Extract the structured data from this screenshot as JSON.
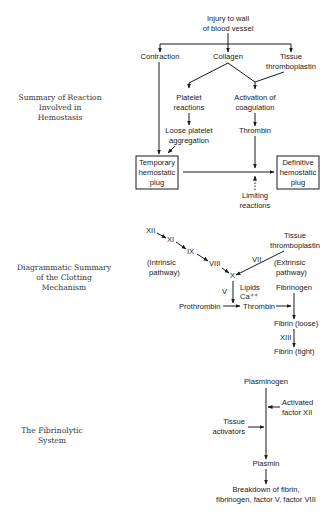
{
  "page": {
    "number": ""
  },
  "section1": {
    "caption": [
      "Summary of Reaction",
      "Involved in",
      "Hemostasis"
    ],
    "nodes": {
      "injury": [
        "Injury to wall",
        "of blood vessel"
      ],
      "contraction": "Contraction",
      "collagen": "Collagen",
      "tissue_thromboplastin": [
        "Tissue",
        "thromboplastin"
      ],
      "platelet_reactions": [
        "Platelet",
        "reactions"
      ],
      "activation": [
        "Activation of",
        "coagulation"
      ],
      "loose_aggregation": [
        "Loose platelet",
        "aggregation"
      ],
      "thrombin": "Thrombin",
      "temporary_plug": [
        "Temporary",
        "hemostatic",
        "plug"
      ],
      "definitive_plug": [
        "Definitive",
        "hemostatic",
        "plug"
      ],
      "limiting": [
        "Limiting",
        "reactions"
      ]
    }
  },
  "section2": {
    "caption": [
      "Diagrammatic Summary",
      "of the Clotting",
      "Mechanism"
    ],
    "nodes": {
      "xii": "XII",
      "xi": "XI",
      "ix": "IX",
      "viii": "VIII",
      "x": "X",
      "vii": "VII",
      "v": "V",
      "intrinsic": [
        "(Intrinsic",
        "pathway)"
      ],
      "extrinsic": [
        "(Extrinsic",
        "pathway)"
      ],
      "tissue_thromboplastin": [
        "Tissue",
        "thromboplastin"
      ],
      "lipids": "Lipids",
      "ca": "Ca⁺⁺",
      "prothrombin": "Prothrombin",
      "thrombin": "Thrombin",
      "fibrinogen": "Fibrinogen",
      "fibrin_loose": "Fibrin (loose)",
      "xiii": "XIII",
      "fibrin_tight": "Fibrin (tight)"
    }
  },
  "section3": {
    "caption": [
      "The Fibrinolytic",
      "System"
    ],
    "nodes": {
      "plasminogen": "Plasminogen",
      "activated_xii": [
        "Activated",
        "factor XII"
      ],
      "tissue_activators": [
        "Tissue",
        "activators"
      ],
      "plasmin": "Plasmin",
      "breakdown": [
        "Breakdown of fibrin,",
        "fibrinogen, factor V, factor VIII"
      ]
    }
  },
  "colors": {
    "ink": "#1a1a1a",
    "caption": "#333333",
    "background": "#ffffff"
  }
}
